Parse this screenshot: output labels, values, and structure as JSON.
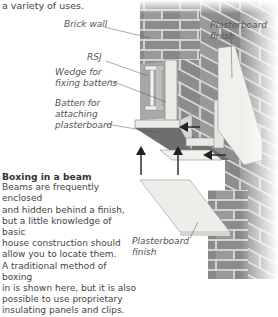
{
  "intro_text": "a variety of uses.",
  "labels": {
    "brick_wall": "Brick wall",
    "rsj": "RSJ",
    "wedge_line1": "Wedge for",
    "wedge_line2": "fixing battens",
    "batten_line1": "Batten for",
    "batten_line2": "attaching",
    "batten_line3": "plasterboard",
    "finish_top_line1": "Plasterboard",
    "finish_top_line2": "finish",
    "finish_bottom_line1": "Plasterboard",
    "finish_bottom_line2": "finish"
  },
  "caption": {
    "title": "Boxing in a beam",
    "lines": [
      "Beams are frequently enclosed",
      "and hidden behind a finish,",
      "but a little knowledge of basic",
      "house construction should",
      "allow you to locate them.",
      "A traditional method of boxing",
      "in is shown here, but it is also",
      "possible to use proprietary",
      "insulating panels and clips."
    ]
  },
  "colors": {
    "brick": "#8a8a8a",
    "mortar": "#d8d8d8",
    "timber": "#e6e6e2",
    "plasterboard": "#eeeeea",
    "text": "#444444"
  }
}
